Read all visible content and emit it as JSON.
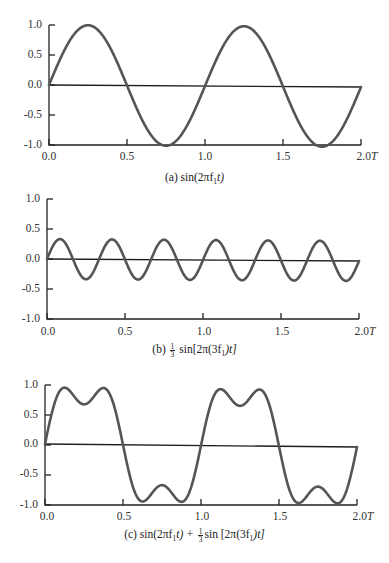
{
  "chart_data": [
    {
      "type": "line",
      "title": "(a) sin(2πf1t)",
      "caption": {
        "label": "(a)",
        "expr": "sin(2πf₁t)"
      },
      "function": "sin(2*pi*t)",
      "x_period_unit": "T",
      "xlim": [
        0,
        2.0
      ],
      "ylim": [
        -1.0,
        1.0
      ],
      "xticks": [
        "0.0",
        "0.5",
        "1.0",
        "1.5",
        "2.0T"
      ],
      "yticks": [
        "1.0",
        "0.5",
        "0.0",
        "-0.5",
        "-1.0"
      ],
      "grid": false,
      "series": [
        {
          "name": "sin(2πf1t)",
          "x": [
            0,
            0.125,
            0.25,
            0.375,
            0.5,
            0.625,
            0.75,
            0.875,
            1.0,
            1.125,
            1.25,
            1.375,
            1.5,
            1.625,
            1.75,
            1.875,
            2.0
          ],
          "values": [
            0,
            0.71,
            1.0,
            0.71,
            0,
            -0.71,
            -1.0,
            -0.71,
            0,
            0.71,
            1.0,
            0.71,
            0,
            -0.71,
            -1.0,
            -0.71,
            0
          ]
        }
      ]
    },
    {
      "type": "line",
      "title": "(b) 1/3 sin[2π(3f1)t]",
      "caption": {
        "label": "(b)",
        "frac_num": "1",
        "frac_den": "3",
        "expr": "sin[2π(3f₁)t]"
      },
      "function": "(1/3)*sin(2*pi*3*t)",
      "x_period_unit": "T",
      "xlim": [
        0,
        2.0
      ],
      "ylim": [
        -1.0,
        1.0
      ],
      "xticks": [
        "0.0",
        "0.5",
        "1.0",
        "1.5",
        "2.0T"
      ],
      "yticks": [
        "1.0",
        "0.5",
        "0.0",
        "-0.5",
        "-1.0"
      ],
      "grid": false,
      "series": [
        {
          "name": "1/3 sin[2π(3f1)t]",
          "x": [
            0,
            0.0833,
            0.1667,
            0.25,
            0.3333,
            0.4167,
            0.5,
            0.5833,
            0.6667,
            0.75,
            0.8333,
            0.9167,
            1.0
          ],
          "values": [
            0,
            0.333,
            0,
            -0.333,
            0,
            0.333,
            0,
            -0.333,
            0,
            0.333,
            0,
            -0.333,
            0
          ]
        }
      ]
    },
    {
      "type": "line",
      "title": "(c) sin(2πf1t) + 1/3 sin[2π(3f1)t]",
      "caption": {
        "label": "(c)",
        "expr1": "sin(2πf₁t) +",
        "frac_num": "1",
        "frac_den": "3",
        "expr2": "sin [2π(3f₁)t]"
      },
      "function": "sin(2*pi*t) + (1/3)*sin(2*pi*3*t)",
      "x_period_unit": "T",
      "xlim": [
        0,
        2.0
      ],
      "ylim": [
        -1.0,
        1.0
      ],
      "xticks": [
        "0.0",
        "0.5",
        "1.0",
        "1.5",
        "2.0T"
      ],
      "yticks": [
        "1.0",
        "0.5",
        "0.0",
        "-0.5",
        "-1.0"
      ],
      "grid": false,
      "series": [
        {
          "name": "sin(2πf1t) + 1/3 sin[2π(3f1)t]",
          "x": [
            0,
            0.125,
            0.25,
            0.375,
            0.5,
            0.625,
            0.75,
            0.875,
            1.0,
            1.125,
            1.25,
            1.375,
            1.5,
            1.625,
            1.75,
            1.875,
            2.0
          ],
          "values": [
            0,
            0.94,
            0.67,
            0.94,
            0,
            -0.94,
            -0.67,
            -0.94,
            0,
            0.94,
            0.67,
            0.94,
            0,
            -0.94,
            -0.67,
            -0.94,
            0
          ]
        }
      ]
    }
  ],
  "panels": [
    {
      "yticks": [
        "1.0",
        "0.5",
        "0.0",
        "-0.5",
        "-1.0"
      ],
      "xticks": [
        "0.0",
        "0.5",
        "1.0",
        "1.5",
        "2.0"
      ],
      "x_unit": "T",
      "caption_label": "(a)",
      "caption_expr": "sin(2πf",
      "caption_sub": "1",
      "caption_tail": "t)"
    },
    {
      "yticks": [
        "1.0",
        "0.5",
        "0.0",
        "-0.5",
        "-1.0"
      ],
      "xticks": [
        "0.0",
        "0.5",
        "1.0",
        "1.5",
        "2.0"
      ],
      "x_unit": "T",
      "caption_label": "(b)",
      "frac_num": "1",
      "frac_den": "3",
      "caption_expr": "sin[2π(3f",
      "caption_sub": "1",
      "caption_tail": ")t]"
    },
    {
      "yticks": [
        "1.0",
        "0.5",
        "0.0",
        "-0.5",
        "-1.0"
      ],
      "xticks": [
        "0.0",
        "0.5",
        "1.0",
        "1.5",
        "2.0"
      ],
      "x_unit": "T",
      "caption_label": "(c)",
      "caption_expr": "sin(2πf",
      "caption_sub": "1",
      "caption_mid": "t) +",
      "frac_num": "1",
      "frac_den": "3",
      "caption_expr2": "sin [2π(3f",
      "caption_sub2": "1",
      "caption_tail": ")t]"
    }
  ],
  "colors": {
    "curve": "#555555",
    "axis": "#222222",
    "background": "#ffffff"
  }
}
